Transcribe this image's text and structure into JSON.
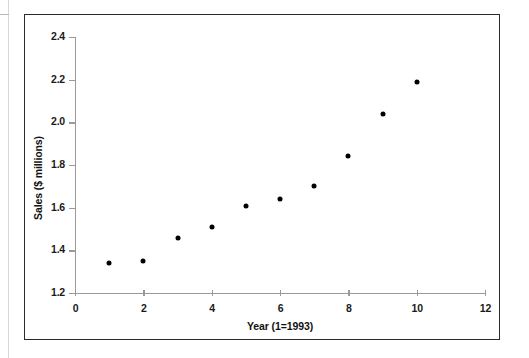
{
  "figure": {
    "frame_color": "#2b2b2b",
    "background": "#ffffff"
  },
  "chart_data": {
    "type": "scatter",
    "title": "",
    "xlabel": "Year (1=1993)",
    "ylabel": "Sales ($ millions)",
    "xlim": [
      0,
      12
    ],
    "ylim": [
      1.2,
      2.4
    ],
    "xticks": [
      0,
      2,
      4,
      6,
      8,
      10,
      12
    ],
    "xtick_labels": [
      "0",
      "2",
      "4",
      "6",
      "8",
      "10",
      "12"
    ],
    "yticks": [
      1.2,
      1.4,
      1.6,
      1.8,
      2.0,
      2.2,
      2.4
    ],
    "ytick_labels": [
      "1.2",
      "1.4",
      "1.6",
      "1.8",
      "2.0",
      "2.2",
      "2.4"
    ],
    "grid": false,
    "legend": null,
    "marker": "filled-circle",
    "marker_color": "#000000",
    "x": [
      1,
      2,
      3,
      4,
      5,
      6,
      7,
      8,
      9,
      10
    ],
    "y": [
      1.34,
      1.35,
      1.46,
      1.51,
      1.61,
      1.64,
      1.7,
      1.84,
      2.04,
      2.19
    ],
    "points": [
      {
        "x": 1,
        "y": 1.34
      },
      {
        "x": 2,
        "y": 1.35
      },
      {
        "x": 3,
        "y": 1.46
      },
      {
        "x": 4,
        "y": 1.51
      },
      {
        "x": 5,
        "y": 1.61
      },
      {
        "x": 6,
        "y": 1.64
      },
      {
        "x": 7,
        "y": 1.7
      },
      {
        "x": 8,
        "y": 1.84
      },
      {
        "x": 9,
        "y": 2.04
      },
      {
        "x": 10,
        "y": 2.19
      }
    ]
  }
}
